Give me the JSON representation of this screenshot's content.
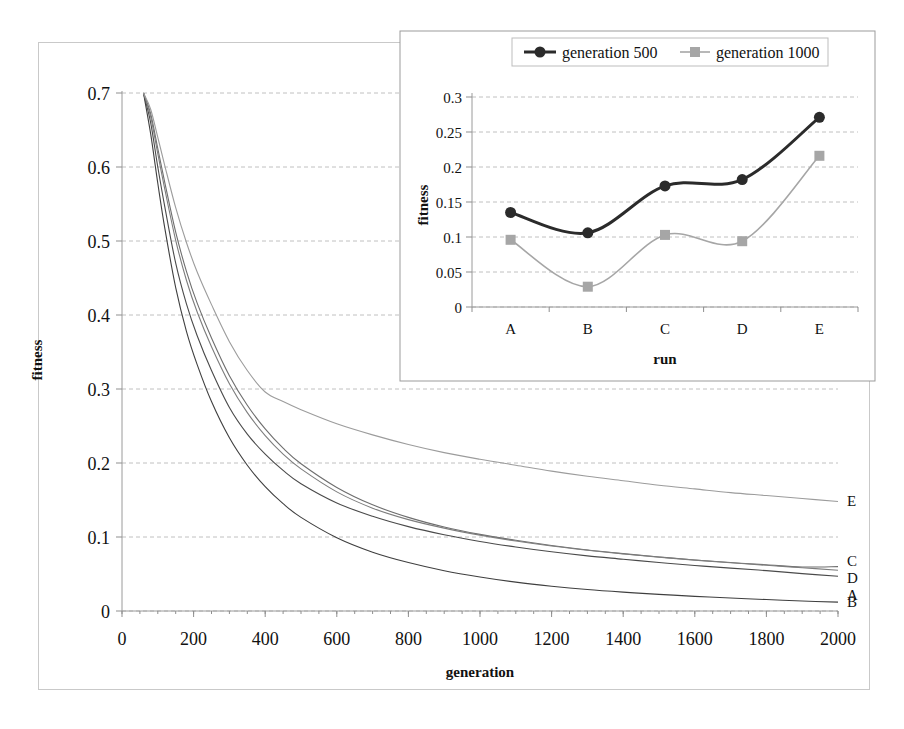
{
  "chart_data": [
    {
      "id": "main",
      "type": "line",
      "title": "",
      "xlabel": "generation",
      "ylabel": "fitness",
      "xlim": [
        0,
        2000
      ],
      "ylim": [
        0,
        0.7
      ],
      "xticks": [
        0,
        200,
        400,
        600,
        800,
        1000,
        1200,
        1400,
        1600,
        1800,
        2000
      ],
      "yticks": [
        0,
        0.1,
        0.2,
        0.3,
        0.4,
        0.5,
        0.6,
        0.7
      ],
      "grid": true,
      "legend": "end-of-line labels",
      "series": [
        {
          "name": "A",
          "end_label": "A",
          "color": "#4a4a4a",
          "x": [
            60,
            80,
            100,
            120,
            150,
            180,
            210,
            250,
            300,
            350,
            400,
            450,
            500,
            600,
            700,
            800,
            900,
            1000,
            1100,
            1200,
            1300,
            1400,
            1500,
            1600,
            1700,
            1800,
            1900,
            2000
          ],
          "y": [
            0.7,
            0.66,
            0.6,
            0.545,
            0.47,
            0.415,
            0.372,
            0.325,
            0.275,
            0.239,
            0.212,
            0.19,
            0.172,
            0.146,
            0.128,
            0.114,
            0.103,
            0.094,
            0.0865,
            0.08,
            0.0745,
            0.07,
            0.0655,
            0.0615,
            0.058,
            0.0545,
            0.0505,
            0.047
          ]
        },
        {
          "name": "B",
          "end_label": "B",
          "color": "#3f3f3f",
          "x": [
            60,
            80,
            100,
            120,
            150,
            180,
            210,
            250,
            300,
            350,
            400,
            450,
            500,
            600,
            700,
            800,
            900,
            1000,
            1100,
            1200,
            1300,
            1400,
            1500,
            1600,
            1700,
            1800,
            1900,
            2000
          ],
          "y": [
            0.7,
            0.645,
            0.578,
            0.516,
            0.437,
            0.378,
            0.333,
            0.283,
            0.234,
            0.197,
            0.168,
            0.145,
            0.1265,
            0.099,
            0.0795,
            0.0655,
            0.0545,
            0.046,
            0.039,
            0.0335,
            0.029,
            0.0255,
            0.0225,
            0.0198,
            0.0175,
            0.0155,
            0.0135,
            0.012
          ]
        },
        {
          "name": "C",
          "end_label": "C",
          "color": "#6e6e6e",
          "x": [
            60,
            80,
            100,
            120,
            150,
            180,
            210,
            250,
            300,
            350,
            400,
            450,
            500,
            600,
            700,
            800,
            900,
            1000,
            1100,
            1200,
            1300,
            1400,
            1500,
            1600,
            1700,
            1800,
            1900,
            2000
          ],
          "y": [
            0.7,
            0.672,
            0.625,
            0.578,
            0.512,
            0.459,
            0.416,
            0.369,
            0.318,
            0.278,
            0.246,
            0.22,
            0.199,
            0.167,
            0.1435,
            0.1265,
            0.1135,
            0.1035,
            0.0955,
            0.0885,
            0.0825,
            0.0775,
            0.073,
            0.069,
            0.0655,
            0.0625,
            0.0595,
            0.06
          ]
        },
        {
          "name": "D",
          "end_label": "D",
          "color": "#7d7d7d",
          "x": [
            60,
            80,
            100,
            120,
            150,
            180,
            210,
            250,
            300,
            350,
            400,
            450,
            500,
            600,
            700,
            800,
            900,
            1000,
            1100,
            1200,
            1300,
            1400,
            1500,
            1600,
            1700,
            1800,
            1900,
            2000
          ],
          "y": [
            0.7,
            0.668,
            0.618,
            0.569,
            0.501,
            0.447,
            0.404,
            0.357,
            0.307,
            0.268,
            0.237,
            0.212,
            0.192,
            0.161,
            0.139,
            0.1235,
            0.112,
            0.1025,
            0.0945,
            0.0878,
            0.0822,
            0.0772,
            0.0728,
            0.0688,
            0.0652,
            0.0618,
            0.0585,
            0.055
          ]
        },
        {
          "name": "E",
          "end_label": "E",
          "color": "#9c9c9c",
          "x": [
            60,
            80,
            100,
            120,
            150,
            180,
            210,
            250,
            300,
            350,
            400,
            450,
            500,
            600,
            700,
            800,
            900,
            1000,
            1100,
            1200,
            1300,
            1400,
            1500,
            1600,
            1700,
            1800,
            1900,
            2000
          ],
          "y": [
            0.7,
            0.678,
            0.64,
            0.601,
            0.545,
            0.498,
            0.458,
            0.414,
            0.364,
            0.325,
            0.296,
            0.283,
            0.272,
            0.253,
            0.238,
            0.225,
            0.214,
            0.205,
            0.197,
            0.189,
            0.182,
            0.176,
            0.17,
            0.165,
            0.16,
            0.156,
            0.152,
            0.148
          ]
        }
      ]
    },
    {
      "id": "inset",
      "type": "line",
      "title": "",
      "xlabel": "run",
      "ylabel": "fitness",
      "categories": [
        "A",
        "B",
        "C",
        "D",
        "E"
      ],
      "ylim": [
        0,
        0.3
      ],
      "yticks": [
        0,
        0.05,
        0.1,
        0.15,
        0.2,
        0.25,
        0.3
      ],
      "grid": true,
      "legend_position": "top",
      "series": [
        {
          "name": "generation 500",
          "marker": "circle",
          "color": "#2b2b2b",
          "values": [
            0.135,
            0.106,
            0.173,
            0.182,
            0.271
          ]
        },
        {
          "name": "generation 1000",
          "marker": "square",
          "color": "#a6a6a6",
          "values": [
            0.096,
            0.029,
            0.103,
            0.094,
            0.216
          ]
        }
      ]
    }
  ],
  "main_chart": {
    "ylabel": "fitness",
    "xlabel": "generation",
    "xticks": [
      "0",
      "200",
      "400",
      "600",
      "800",
      "1000",
      "1200",
      "1400",
      "1600",
      "1800",
      "2000"
    ],
    "yticks": [
      "0",
      "0.1",
      "0.2",
      "0.3",
      "0.4",
      "0.5",
      "0.6",
      "0.7"
    ],
    "end_labels": [
      "E",
      "C",
      "D",
      "A",
      "B"
    ]
  },
  "inset_chart": {
    "ylabel": "fitness",
    "xlabel": "run",
    "yticks": [
      "0",
      "0.05",
      "0.1",
      "0.15",
      "0.2",
      "0.25",
      "0.3"
    ],
    "categories": [
      "A",
      "B",
      "C",
      "D",
      "E"
    ],
    "legend": [
      {
        "label": "generation 500",
        "marker": "circle",
        "color": "#2b2b2b"
      },
      {
        "label": "generation 1000",
        "marker": "square",
        "color": "#a6a6a6"
      }
    ]
  }
}
